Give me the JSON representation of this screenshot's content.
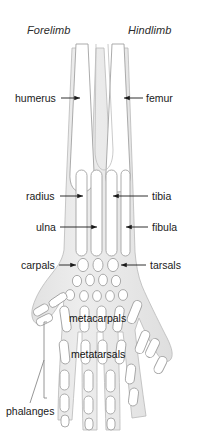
{
  "figure": {
    "headers": {
      "left": "Forelimb",
      "right": "Hindlimb"
    },
    "colors": {
      "background": "#ffffff",
      "limb_fill": "#e9e9e9",
      "limb_stroke": "#b4b4b4",
      "bone_fill": "#ffffff",
      "bone_stroke": "#9a9a9a",
      "label_text": "#1a1a1a",
      "header_text": "#2b2b2b",
      "leader_line": "#1a1a1a",
      "bracket_line": "#8a8a8a"
    },
    "labels": {
      "humerus": "humerus",
      "femur": "femur",
      "radius": "radius",
      "tibia": "tibia",
      "ulna": "ulna",
      "fibula": "fibula",
      "carpals": "carpals",
      "tarsals": "tarsals",
      "metacarpals": "metacarpals",
      "metatarsals": "metatarsals",
      "phalanges": "phalanges"
    },
    "annotation_style": {
      "left_labels_have_right_arrow": true,
      "right_labels_have_left_arrow": true,
      "phalanges_has_bracket": true
    }
  }
}
